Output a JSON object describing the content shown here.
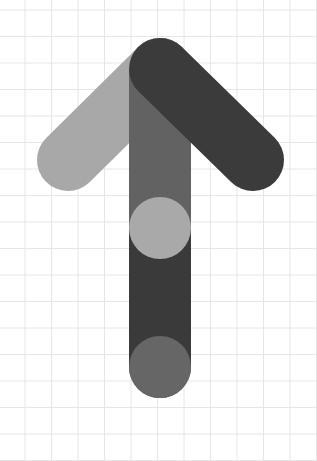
{
  "canvas": {
    "width": 317,
    "height": 461,
    "background": "#ffffff"
  },
  "grid": {
    "color": "#e6e6e6",
    "spacing": 26.5,
    "x_offset": 25,
    "y_offset": 10
  },
  "logo": {
    "name": "up-arrow-logo",
    "colors": {
      "left_arm": "#a8a8a8",
      "right_arm": "#3b3b3b",
      "stem_upper": "#626262",
      "stem_lower": "#3a3a3a",
      "upper_dot": "#a9a9a9",
      "lower_dot": "#666666"
    },
    "stroke_width": 62,
    "apex": [
      160,
      69
    ],
    "left_end": [
      68,
      160
    ],
    "right_end": [
      253,
      160
    ],
    "stem_mid": [
      160,
      228
    ],
    "stem_bottom": [
      160,
      367
    ],
    "dot_radius": 31
  }
}
